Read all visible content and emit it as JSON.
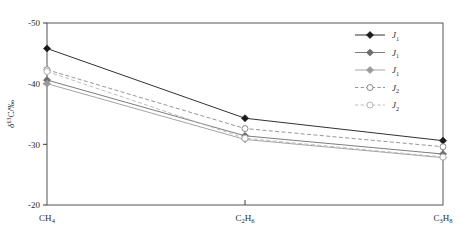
{
  "chart_data": {
    "type": "line",
    "title": "",
    "xlabel": "",
    "ylabel": "δ¹³C/‰",
    "ylabel_main": "C/‰",
    "ylabel_delta": "δ",
    "ylabel_sup": "13",
    "categories": [
      "CH4",
      "C2H6",
      "C3H8"
    ],
    "category_labels": [
      {
        "pre": "CH",
        "sub": "4",
        "post": ""
      },
      {
        "pre": "C",
        "sub": "2",
        "mid": "H",
        "sub2": "6",
        "post": ""
      },
      {
        "pre": "C",
        "sub": "3",
        "mid": "H",
        "sub2": "8",
        "post": ""
      }
    ],
    "ytick_labels": [
      "-50",
      "-40",
      "-30",
      "-20"
    ],
    "yticks": [
      -50,
      -40,
      -30,
      -20
    ],
    "ylim": [
      -50,
      -20
    ],
    "y_inverted": true,
    "grid": false,
    "legend_position": "top-right",
    "series": [
      {
        "name": "J1",
        "label_main": "J",
        "label_sub": "1",
        "marker": "filled-diamond",
        "linestyle": "solid",
        "color": "#1a1a1a",
        "values": [
          -45.8,
          -34.3,
          -30.6
        ]
      },
      {
        "name": "J1",
        "label_main": "J",
        "label_sub": "1",
        "marker": "filled-diamond",
        "linestyle": "solid",
        "color": "#6e6e6e",
        "values": [
          -40.6,
          -31.4,
          -28.4
        ]
      },
      {
        "name": "J1",
        "label_main": "J",
        "label_sub": "1",
        "marker": "filled-diamond",
        "linestyle": "solid",
        "color": "#9a9a9a",
        "values": [
          -40.0,
          -30.8,
          -27.8
        ]
      },
      {
        "name": "J2",
        "label_main": "J",
        "label_sub": "2",
        "marker": "open-circle",
        "linestyle": "dashed",
        "color": "#8a8a8a",
        "values": [
          -42.3,
          -32.6,
          -29.6
        ]
      },
      {
        "name": "J2",
        "label_main": "J",
        "label_sub": "2",
        "marker": "open-circle",
        "linestyle": "dashed",
        "color": "#b5b5b5",
        "values": [
          -42.0,
          -31.0,
          -27.9
        ]
      }
    ],
    "colors": {
      "axis": "#3a3a3a",
      "border": "#555555",
      "text": "#2b2b2b",
      "background": "#ffffff"
    }
  },
  "legend": {
    "entries": [
      {
        "label_main": "J",
        "label_sub": "1"
      },
      {
        "label_main": "J",
        "label_sub": "1"
      },
      {
        "label_main": "J",
        "label_sub": "1"
      },
      {
        "label_main": "J",
        "label_sub": "2"
      },
      {
        "label_main": "J",
        "label_sub": "2"
      }
    ]
  }
}
